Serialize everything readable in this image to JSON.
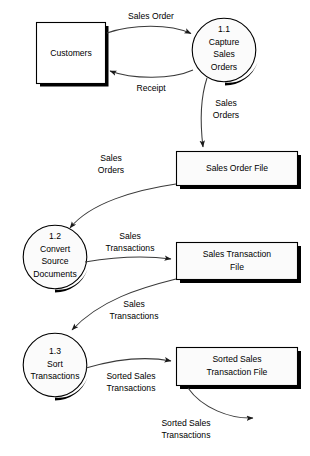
{
  "diagram": {
    "type": "data-flow-diagram",
    "external_entities": [
      {
        "id": "customers",
        "label": "Customers"
      }
    ],
    "processes": [
      {
        "id": "p11",
        "number": "1.1",
        "line1": "Capture",
        "line2": "Sales",
        "line3": "Orders"
      },
      {
        "id": "p12",
        "number": "1.2",
        "line1": "Convert",
        "line2": "Source",
        "line3": "Documents"
      },
      {
        "id": "p13",
        "number": "1.3",
        "line1": "Sort",
        "line2": "Transactions",
        "line3": ""
      }
    ],
    "data_stores": [
      {
        "id": "ds1",
        "line1": "Sales Order File",
        "line2": ""
      },
      {
        "id": "ds2",
        "line1": "Sales Transaction",
        "line2": "File"
      },
      {
        "id": "ds3",
        "line1": "Sorted Sales",
        "line2": "Transaction File"
      }
    ],
    "flows": [
      {
        "id": "f1",
        "label": "Sales Order",
        "from": "customers",
        "to": "p11"
      },
      {
        "id": "f2",
        "label": "Receipt",
        "from": "p11",
        "to": "customers"
      },
      {
        "id": "f3",
        "line1": "Sales",
        "line2": "Orders",
        "from": "p11",
        "to": "ds1"
      },
      {
        "id": "f4",
        "line1": "Sales",
        "line2": "Orders",
        "from": "ds1",
        "to": "p12"
      },
      {
        "id": "f5",
        "line1": "Sales",
        "line2": "Transactions",
        "from": "p12",
        "to": "ds2"
      },
      {
        "id": "f6",
        "line1": "Sales",
        "line2": "Transactions",
        "from": "ds2",
        "to": "p13"
      },
      {
        "id": "f7",
        "line1": "Sorted Sales",
        "line2": "Transactions",
        "from": "p13",
        "to": "ds3"
      },
      {
        "id": "f8",
        "line1": "Sorted Sales",
        "line2": "Transactions",
        "from": "ds3",
        "to": "external"
      }
    ],
    "colors": {
      "stroke": "#000000",
      "flow_stroke": "#3a3a3a",
      "fill": "#ffffff",
      "store_fill": "#fbfbfb",
      "background": "#ffffff"
    }
  }
}
